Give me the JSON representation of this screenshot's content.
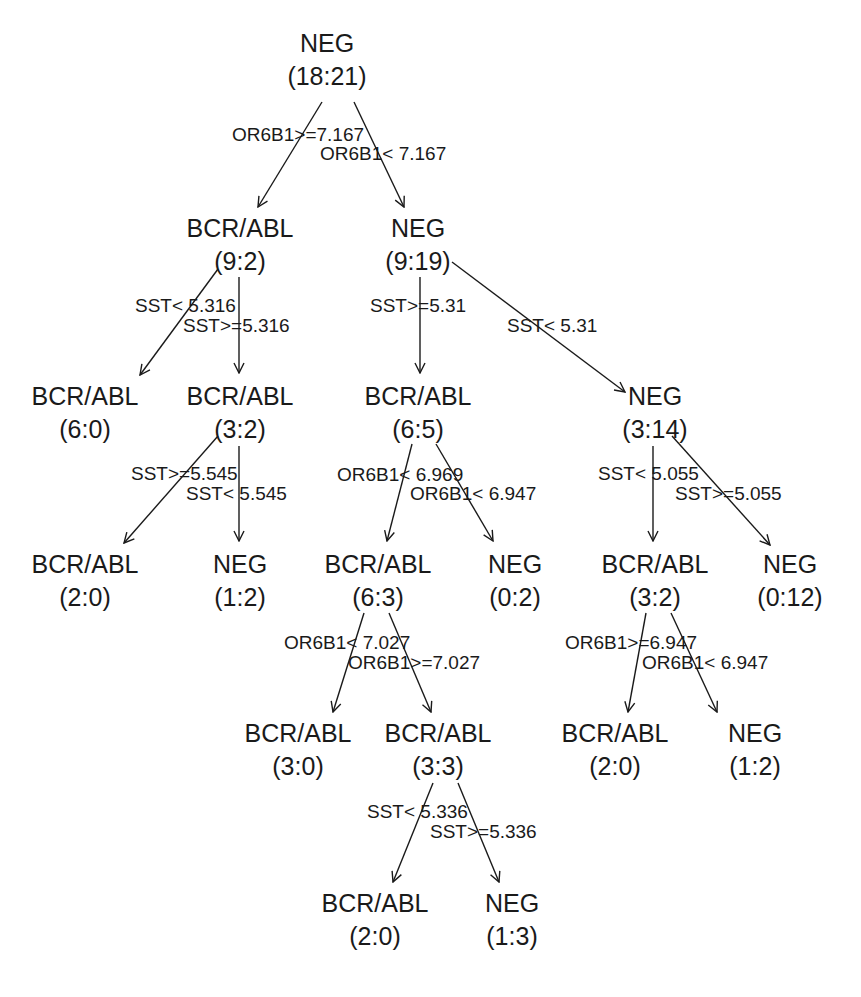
{
  "diagram": {
    "type": "decision-tree",
    "nodes": [
      {
        "id": "n1",
        "class": "NEG",
        "counts": "(18:21)",
        "x": 327,
        "y": 45
      },
      {
        "id": "n2",
        "class": "BCR/ABL",
        "counts": "(9:2)",
        "x": 240,
        "y": 230
      },
      {
        "id": "n3",
        "class": "NEG",
        "counts": "(9:19)",
        "x": 418,
        "y": 230
      },
      {
        "id": "n4",
        "class": "BCR/ABL",
        "counts": "(6:0)",
        "x": 85,
        "y": 398
      },
      {
        "id": "n5",
        "class": "BCR/ABL",
        "counts": "(3:2)",
        "x": 240,
        "y": 398
      },
      {
        "id": "n6",
        "class": "BCR/ABL",
        "counts": "(6:5)",
        "x": 418,
        "y": 398
      },
      {
        "id": "n7",
        "class": "NEG",
        "counts": "(3:14)",
        "x": 655,
        "y": 398
      },
      {
        "id": "n8",
        "class": "BCR/ABL",
        "counts": "(2:0)",
        "x": 85,
        "y": 566
      },
      {
        "id": "n9",
        "class": "NEG",
        "counts": "(1:2)",
        "x": 240,
        "y": 566
      },
      {
        "id": "n10",
        "class": "BCR/ABL",
        "counts": "(6:3)",
        "x": 378,
        "y": 566
      },
      {
        "id": "n11",
        "class": "NEG",
        "counts": "(0:2)",
        "x": 515,
        "y": 566
      },
      {
        "id": "n12",
        "class": "BCR/ABL",
        "counts": "(3:2)",
        "x": 655,
        "y": 566
      },
      {
        "id": "n13",
        "class": "NEG",
        "counts": "(0:12)",
        "x": 790,
        "y": 566
      },
      {
        "id": "n14",
        "class": "BCR/ABL",
        "counts": "(3:0)",
        "x": 298,
        "y": 735
      },
      {
        "id": "n15",
        "class": "BCR/ABL",
        "counts": "(3:3)",
        "x": 438,
        "y": 735
      },
      {
        "id": "n16",
        "class": "BCR/ABL",
        "counts": "(2:0)",
        "x": 615,
        "y": 735
      },
      {
        "id": "n17",
        "class": "NEG",
        "counts": "(1:2)",
        "x": 755,
        "y": 735
      },
      {
        "id": "n18",
        "class": "BCR/ABL",
        "counts": "(2:0)",
        "x": 375,
        "y": 905
      },
      {
        "id": "n19",
        "class": "NEG",
        "counts": "(1:3)",
        "x": 512,
        "y": 905
      }
    ],
    "edges": [
      {
        "from": "n1",
        "to": "n2",
        "label": "OR6B1>=7.167",
        "x1": 322,
        "y1": 102,
        "x2": 258,
        "y2": 207,
        "lx": 232,
        "ly": 141
      },
      {
        "from": "n1",
        "to": "n3",
        "label": "OR6B1< 7.167",
        "x1": 354,
        "y1": 102,
        "x2": 404,
        "y2": 207,
        "lx": 320,
        "ly": 160
      },
      {
        "from": "n2",
        "to": "n4",
        "label": "SST< 5.316",
        "x1": 218,
        "y1": 269,
        "x2": 140,
        "y2": 375,
        "lx": 135,
        "ly": 312
      },
      {
        "from": "n2",
        "to": "n5",
        "label": "SST>=5.316",
        "x1": 239,
        "y1": 277,
        "x2": 239,
        "y2": 373,
        "lx": 183,
        "ly": 332
      },
      {
        "from": "n3",
        "to": "n6",
        "label": "SST>=5.31",
        "x1": 420,
        "y1": 277,
        "x2": 420,
        "y2": 373,
        "lx": 370,
        "ly": 312
      },
      {
        "from": "n3",
        "to": "n7",
        "label": "SST< 5.31",
        "x1": 452,
        "y1": 262,
        "x2": 625,
        "y2": 392,
        "lx": 507,
        "ly": 332
      },
      {
        "from": "n5",
        "to": "n8",
        "label": "SST>=5.545",
        "x1": 218,
        "y1": 436,
        "x2": 124,
        "y2": 543,
        "lx": 131,
        "ly": 480
      },
      {
        "from": "n5",
        "to": "n9",
        "label": "SST< 5.545",
        "x1": 239,
        "y1": 446,
        "x2": 239,
        "y2": 541,
        "lx": 186,
        "ly": 500
      },
      {
        "from": "n6",
        "to": "n10",
        "label": "OR6B1< 6.969",
        "x1": 412,
        "y1": 444,
        "x2": 387,
        "y2": 541,
        "lx": 337,
        "ly": 481
      },
      {
        "from": "n6",
        "to": "n11",
        "label": "OR6B1< 6.947",
        "x1": 436,
        "y1": 444,
        "x2": 493,
        "y2": 541,
        "lx": 410,
        "ly": 500
      },
      {
        "from": "n7",
        "to": "n12",
        "label": "SST< 5.055",
        "x1": 653,
        "y1": 446,
        "x2": 653,
        "y2": 541,
        "lx": 598,
        "ly": 480
      },
      {
        "from": "n7",
        "to": "n13",
        "label": "SST>=5.055",
        "x1": 672,
        "y1": 436,
        "x2": 770,
        "y2": 545,
        "lx": 675,
        "ly": 500
      },
      {
        "from": "n10",
        "to": "n14",
        "label": "OR6B1< 7.027",
        "x1": 364,
        "y1": 613,
        "x2": 333,
        "y2": 712,
        "lx": 284,
        "ly": 649
      },
      {
        "from": "n10",
        "to": "n15",
        "label": "OR6B1>=7.027",
        "x1": 389,
        "y1": 613,
        "x2": 431,
        "y2": 712,
        "lx": 348,
        "ly": 669
      },
      {
        "from": "n12",
        "to": "n16",
        "label": "OR6B1>=6.947",
        "x1": 646,
        "y1": 613,
        "x2": 628,
        "y2": 712,
        "lx": 565,
        "ly": 649
      },
      {
        "from": "n12",
        "to": "n17",
        "label": "OR6B1< 6.947",
        "x1": 671,
        "y1": 613,
        "x2": 717,
        "y2": 712,
        "lx": 642,
        "ly": 669
      },
      {
        "from": "n15",
        "to": "n18",
        "label": "SST< 5.336",
        "x1": 433,
        "y1": 783,
        "x2": 393,
        "y2": 882,
        "lx": 367,
        "ly": 818
      },
      {
        "from": "n15",
        "to": "n19",
        "label": "SST>=5.336",
        "x1": 458,
        "y1": 783,
        "x2": 499,
        "y2": 882,
        "lx": 430,
        "ly": 838
      }
    ]
  }
}
